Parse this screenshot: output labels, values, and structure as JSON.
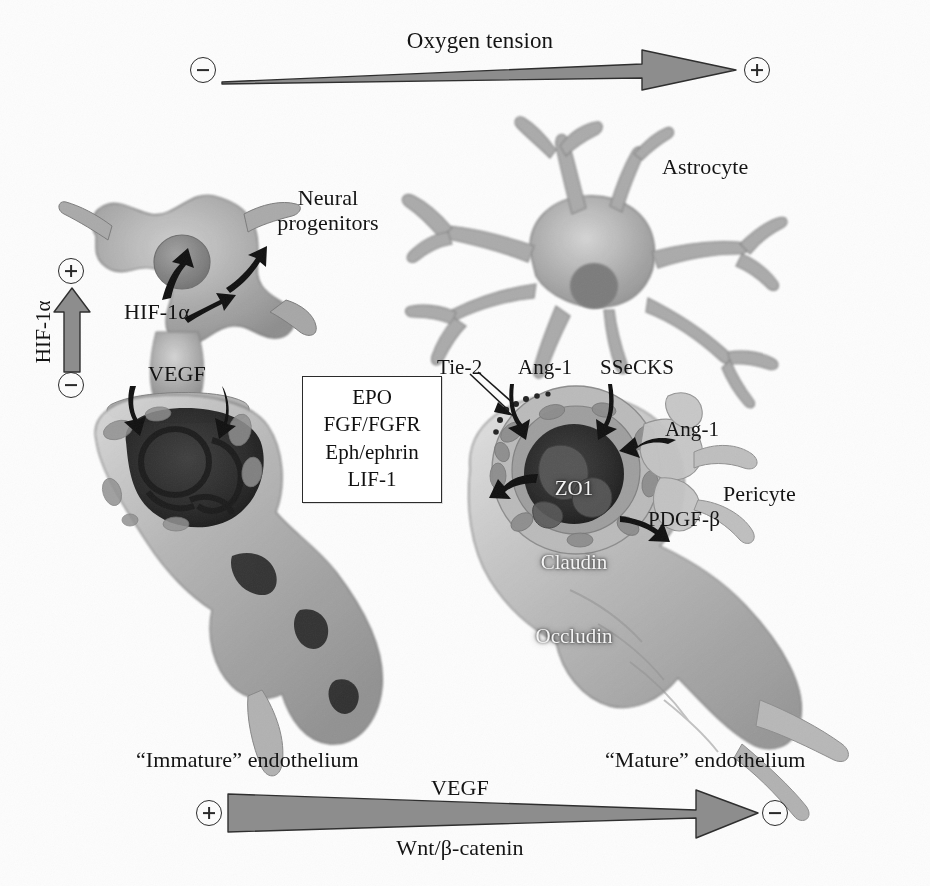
{
  "figure": {
    "title_visible": false,
    "background": "#ffffff",
    "ink": "#141414",
    "cell_gray": "#9a9a9a",
    "arrow_gray": "#8d8d8d",
    "arrow_outline": "#2f2f2f",
    "lumen_dark": "#2a2a2a"
  },
  "top_axis": {
    "label": "Oxygen tension",
    "left_sign": "−",
    "right_sign": "+",
    "direction": "left-to-right increasing",
    "shape": "tapered arrow, thin at left, thick at right"
  },
  "left_axis": {
    "label": "HIF-1α",
    "bottom_sign": "−",
    "top_sign": "+",
    "direction": "bottom-to-top increasing",
    "shape": "straight arrow pointing up"
  },
  "bottom_axis": {
    "label_top": "VEGF",
    "label_bottom": "Wnt/β-catenin",
    "left_sign": "+",
    "right_sign": "−",
    "direction": "left-to-right decreasing",
    "shape": "tapered arrow, thick at left, thin at right"
  },
  "cells": {
    "neural_progenitors": "Neural\nprogenitors",
    "astrocyte": "Astrocyte",
    "pericyte": "Pericyte"
  },
  "annotations": {
    "hif1a": "HIF-1α",
    "vegf": "VEGF",
    "tie2": "Tie-2",
    "ang1_left": "Ang-1",
    "ssecks": "SSeCKS",
    "ang1_right": "Ang-1",
    "pdgfb": "PDGF-β"
  },
  "junction_proteins": {
    "lines": [
      "ZO1",
      "Claudin",
      "Occludin"
    ]
  },
  "signaling_box": {
    "items": [
      "EPO",
      "FGF/FGFR",
      "Eph/ephrin",
      "LIF-1"
    ]
  },
  "endothelium": {
    "immature": "“Immature” endothelium",
    "mature": "“Mature” endothelium"
  }
}
